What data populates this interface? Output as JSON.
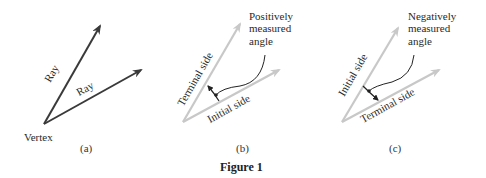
{
  "figure": {
    "title": "Figure 1",
    "panels": [
      {
        "id": "a",
        "caption": "(a)",
        "labels": {
          "vertex": "Vertex",
          "ray_upper": "Ray",
          "ray_lower": "Ray"
        }
      },
      {
        "id": "b",
        "caption": "(b)",
        "labels": {
          "terminal_side": "Terminal side",
          "initial_side": "Initial side",
          "annotation_line1": "Positively",
          "annotation_line2": "measured",
          "annotation_line3": "angle"
        }
      },
      {
        "id": "c",
        "caption": "(c)",
        "labels": {
          "initial_side": "Initial side",
          "terminal_side": "Terminal side",
          "annotation_line1": "Negatively",
          "annotation_line2": "measured",
          "annotation_line3": "angle"
        }
      }
    ],
    "colors": {
      "dark_ray": "#3a3a3a",
      "light_ray": "#c8c8c8",
      "text": "#2a2a2a"
    }
  }
}
